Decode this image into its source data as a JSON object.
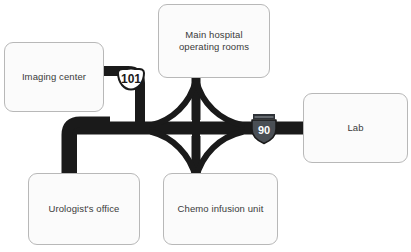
{
  "diagram": {
    "background_color": "#ffffff",
    "road_color": "#1a1a1a",
    "node_fill": "#fbfbfb",
    "node_border": "#b8b8b8",
    "node_text_color": "#3a3a3a"
  },
  "nodes": [
    {
      "id": "imaging-center",
      "label": "Imaging center"
    },
    {
      "id": "main-hospital",
      "label": "Main hospital\noperating rooms"
    },
    {
      "id": "lab",
      "label": "Lab"
    },
    {
      "id": "urologists-office",
      "label": "Urologist's office"
    },
    {
      "id": "chemo-infusion-unit",
      "label": "Chemo infusion unit"
    }
  ],
  "shields": [
    {
      "id": "route-101",
      "number": "101",
      "type": "us-route-shield",
      "fill": "#ffffff",
      "text_color": "#1a1a1a"
    },
    {
      "id": "interstate-90",
      "number": "90",
      "type": "interstate-shield",
      "fill": "#4a4f55",
      "banner_fill": "#2e3237",
      "text_color": "#ffffff"
    }
  ],
  "roads": {
    "interchange": "cloverleaf",
    "center_marker": "plus-cross"
  }
}
